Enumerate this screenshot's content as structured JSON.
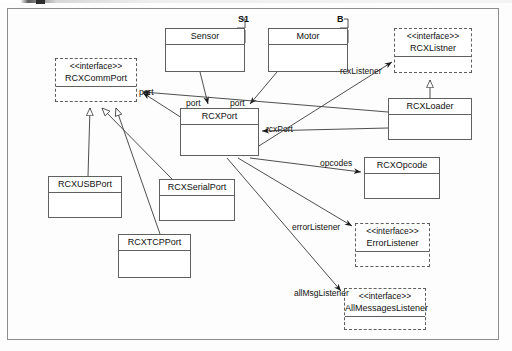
{
  "diagram": {
    "kind": "uml-class-diagram",
    "stereotype_text": "<<interface>>",
    "classes": [
      {
        "id": "sensor",
        "name": "Sensor",
        "kind": "class",
        "x": 165,
        "y": 28,
        "w": 80,
        "h": 44,
        "header_h": 14
      },
      {
        "id": "motor",
        "name": "Motor",
        "kind": "class",
        "x": 268,
        "y": 28,
        "w": 80,
        "h": 44,
        "header_h": 14
      },
      {
        "id": "rcxlistner",
        "name": "RCXListner",
        "kind": "interface",
        "x": 394,
        "y": 28,
        "w": 78,
        "h": 45
      },
      {
        "id": "rcxcommport",
        "name": "RCXCommPort",
        "kind": "interface",
        "x": 55,
        "y": 58,
        "w": 82,
        "h": 44
      },
      {
        "id": "rcxloader",
        "name": "RCXLoader",
        "kind": "class",
        "x": 388,
        "y": 98,
        "w": 84,
        "h": 42,
        "header_h": 14
      },
      {
        "id": "rcxport",
        "name": "RCXPort",
        "kind": "class",
        "x": 180,
        "y": 108,
        "w": 79,
        "h": 48,
        "header_h": 14
      },
      {
        "id": "rcxopcode",
        "name": "RCXOpcode",
        "kind": "class",
        "x": 364,
        "y": 157,
        "w": 76,
        "h": 42,
        "header_h": 14
      },
      {
        "id": "rcxusbport",
        "name": "RCXUSBPort",
        "kind": "class",
        "x": 48,
        "y": 176,
        "w": 74,
        "h": 42,
        "header_h": 14
      },
      {
        "id": "rcxserial",
        "name": "RCXSerialPort",
        "kind": "class",
        "x": 159,
        "y": 179,
        "w": 76,
        "h": 42,
        "header_h": 14
      },
      {
        "id": "errorlist",
        "name": "ErrorListener",
        "kind": "interface",
        "x": 355,
        "y": 223,
        "w": 75,
        "h": 44
      },
      {
        "id": "rcxtcpport",
        "name": "RCXTCPPort",
        "kind": "class",
        "x": 118,
        "y": 234,
        "w": 73,
        "h": 44,
        "header_h": 14
      },
      {
        "id": "allmsglist",
        "name": "AllMessagesListener",
        "kind": "interface",
        "x": 344,
        "y": 288,
        "w": 82,
        "h": 42
      }
    ],
    "edge_labels": [
      {
        "id": "lbl-port-left",
        "text": "port",
        "x": 139,
        "y": 87
      },
      {
        "id": "lbl-port-mid",
        "text": "port",
        "x": 186,
        "y": 98
      },
      {
        "id": "lbl-port-right",
        "text": "port",
        "x": 230,
        "y": 98
      },
      {
        "id": "lbl-rcxlistener",
        "text": "rcxListener",
        "x": 340,
        "y": 66
      },
      {
        "id": "lbl-rcxport",
        "text": "rcxPort",
        "x": 266,
        "y": 124
      },
      {
        "id": "lbl-opcodes",
        "text": "opcodes",
        "x": 320,
        "y": 158
      },
      {
        "id": "lbl-errorlist",
        "text": "errorListener",
        "x": 292,
        "y": 222
      },
      {
        "id": "lbl-allmsg",
        "text": "allMsgListener",
        "x": 294,
        "y": 288
      }
    ],
    "multiplicity_labels": [
      {
        "id": "lbl-s1",
        "text": "S1",
        "x": 238,
        "y": 14
      },
      {
        "id": "lbl-b",
        "text": "B",
        "x": 337,
        "y": 14
      }
    ]
  }
}
